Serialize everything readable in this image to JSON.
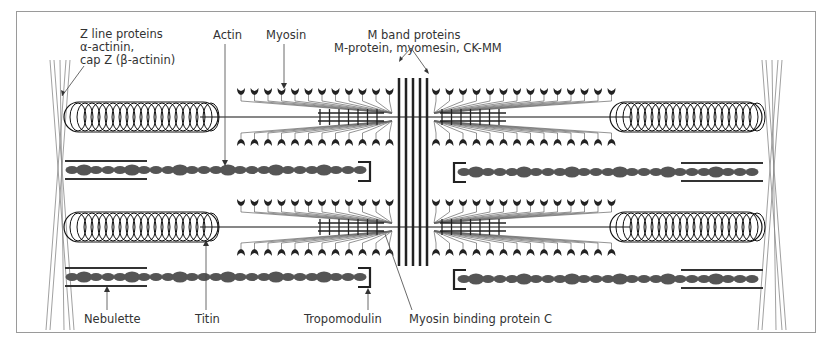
{
  "figure": {
    "labels": {
      "z_line": [
        "Z line proteins",
        "α-actinin,",
        "cap Z (β-actinin)"
      ],
      "actin": "Actin",
      "myosin": "Myosin",
      "m_band": [
        "M band proteins",
        "M-protein, myomesin, CK-MM"
      ],
      "nebulette": "Nebulette",
      "titin": "Titin",
      "tropomodulin": "Tropomodulin",
      "myosin_binding_protein_c": "Myosin binding protein C"
    },
    "colors": {
      "frame": "#9a9a9a",
      "line": "#222222",
      "filament": "#555555",
      "text": "#333333"
    }
  }
}
